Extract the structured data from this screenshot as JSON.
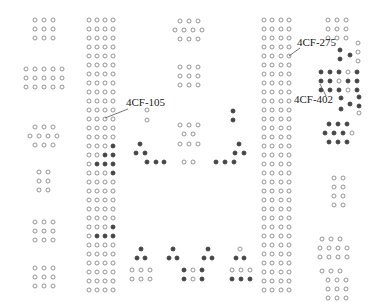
{
  "colors": {
    "open_stroke": "#8a8a8a",
    "filled": "#444444",
    "leader": "#555555",
    "text": "#222222"
  },
  "labels": [
    {
      "id": "4CF-105",
      "text": "4CF-105",
      "x": 126,
      "y": 103,
      "tx": 105,
      "ty": 118
    },
    {
      "id": "4CF-275",
      "text": "4CF-275",
      "x": 298,
      "y": 42,
      "tx": 289,
      "ty": 56
    },
    {
      "id": "4CF-402",
      "text": "4CF-402",
      "x": 296,
      "y": 98,
      "tx": 320,
      "ty": 84
    }
  ],
  "dot_radius": 2,
  "grids": [
    {
      "name": "left-a",
      "xs": [
        35,
        44,
        53
      ],
      "ys": [
        20,
        29,
        38
      ]
    },
    {
      "name": "left-b",
      "xs": [
        26,
        35,
        44,
        53,
        62
      ],
      "ys": [
        69,
        78,
        87
      ]
    },
    {
      "name": "left-c1",
      "xs": [
        35,
        44,
        53
      ],
      "ys": [
        127
      ]
    },
    {
      "name": "left-c2",
      "xs": [
        30,
        39,
        48,
        57
      ],
      "ys": [
        136
      ]
    },
    {
      "name": "left-c3",
      "xs": [
        35,
        44,
        53
      ],
      "ys": [
        145
      ]
    },
    {
      "name": "left-d",
      "xs": [
        39,
        48
      ],
      "ys": [
        172,
        181,
        190
      ]
    },
    {
      "name": "left-e",
      "xs": [
        35,
        44,
        53
      ],
      "ys": [
        222,
        231,
        240
      ]
    },
    {
      "name": "left-f",
      "xs": [
        35,
        44,
        53
      ],
      "ys": [
        268,
        277,
        286
      ]
    },
    {
      "name": "mid-a1",
      "xs": [
        180,
        189,
        198
      ],
      "ys": [
        21
      ]
    },
    {
      "name": "mid-a2",
      "xs": [
        175,
        184,
        193,
        202
      ],
      "ys": [
        30
      ]
    },
    {
      "name": "mid-a3",
      "xs": [
        180,
        189,
        198
      ],
      "ys": [
        39
      ]
    },
    {
      "name": "mid-b",
      "xs": [
        180,
        189,
        198
      ],
      "ys": [
        67,
        76,
        85
      ]
    },
    {
      "name": "column-2",
      "xs": [
        89,
        97,
        105,
        113
      ],
      "ys_start": 20,
      "ys_step": 9,
      "ys_count": 31
    },
    {
      "name": "column-4",
      "xs": [
        264,
        272,
        281,
        289
      ],
      "ys_start": 20,
      "ys_step": 9,
      "ys_count": 31
    },
    {
      "name": "right-a",
      "xs": [
        328,
        337,
        346
      ],
      "ys": [
        20,
        29,
        38
      ]
    },
    {
      "name": "right-b",
      "xs": [
        322,
        331,
        340
      ],
      "ys": [
        239
      ]
    },
    {
      "name": "right-c",
      "xs": [
        320,
        329,
        338,
        347
      ],
      "ys": [
        248,
        257
      ]
    },
    {
      "name": "right-d",
      "xs": [
        322,
        331,
        340
      ],
      "ys": [
        271
      ]
    },
    {
      "name": "right-e",
      "xs": [
        328,
        337,
        346
      ],
      "ys": [
        280,
        289,
        298
      ]
    },
    {
      "name": "right-f",
      "xs": [
        334,
        343
      ],
      "ys": [
        178,
        187,
        196,
        205
      ]
    }
  ],
  "filled_in_columns": {
    "column-2": [
      [
        14,
        3
      ],
      [
        15,
        2
      ],
      [
        15,
        3
      ],
      [
        16,
        1
      ],
      [
        16,
        2
      ],
      [
        16,
        3
      ],
      [
        17,
        3
      ],
      [
        23,
        3
      ],
      [
        24,
        1
      ],
      [
        24,
        2
      ],
      [
        24,
        3
      ]
    ],
    "column-4": []
  },
  "singles": [
    {
      "x": 147,
      "y": 110,
      "f": false
    },
    {
      "x": 147,
      "y": 120,
      "f": false
    },
    {
      "x": 233,
      "y": 111,
      "f": true
    },
    {
      "x": 233,
      "y": 120,
      "f": true
    },
    {
      "x": 140,
      "y": 144,
      "f": true
    },
    {
      "x": 136,
      "y": 153,
      "f": true
    },
    {
      "x": 145,
      "y": 153,
      "f": true
    },
    {
      "x": 147,
      "y": 162,
      "f": true
    },
    {
      "x": 156,
      "y": 162,
      "f": true
    },
    {
      "x": 164,
      "y": 162,
      "f": true
    },
    {
      "x": 180,
      "y": 125,
      "f": false
    },
    {
      "x": 189,
      "y": 125,
      "f": false
    },
    {
      "x": 198,
      "y": 125,
      "f": false
    },
    {
      "x": 184,
      "y": 134,
      "f": false
    },
    {
      "x": 193,
      "y": 134,
      "f": false
    },
    {
      "x": 180,
      "y": 144,
      "f": false
    },
    {
      "x": 189,
      "y": 144,
      "f": false
    },
    {
      "x": 198,
      "y": 144,
      "f": false
    },
    {
      "x": 184,
      "y": 162,
      "f": false
    },
    {
      "x": 193,
      "y": 162,
      "f": false
    },
    {
      "x": 216,
      "y": 162,
      "f": true
    },
    {
      "x": 225,
      "y": 162,
      "f": true
    },
    {
      "x": 234,
      "y": 162,
      "f": true
    },
    {
      "x": 239,
      "y": 144,
      "f": true
    },
    {
      "x": 235,
      "y": 153,
      "f": true
    },
    {
      "x": 244,
      "y": 153,
      "f": true
    },
    {
      "x": 141,
      "y": 249,
      "f": true
    },
    {
      "x": 137,
      "y": 258,
      "f": true
    },
    {
      "x": 145,
      "y": 258,
      "f": true
    },
    {
      "x": 132,
      "y": 270,
      "f": false
    },
    {
      "x": 141,
      "y": 270,
      "f": false
    },
    {
      "x": 150,
      "y": 270,
      "f": false
    },
    {
      "x": 132,
      "y": 279,
      "f": false
    },
    {
      "x": 141,
      "y": 279,
      "f": false
    },
    {
      "x": 150,
      "y": 279,
      "f": false
    },
    {
      "x": 173,
      "y": 249,
      "f": true
    },
    {
      "x": 169,
      "y": 258,
      "f": true
    },
    {
      "x": 177,
      "y": 258,
      "f": true
    },
    {
      "x": 184,
      "y": 270,
      "f": true
    },
    {
      "x": 193,
      "y": 270,
      "f": false
    },
    {
      "x": 202,
      "y": 270,
      "f": true
    },
    {
      "x": 184,
      "y": 279,
      "f": true
    },
    {
      "x": 193,
      "y": 279,
      "f": false
    },
    {
      "x": 202,
      "y": 279,
      "f": true
    },
    {
      "x": 208,
      "y": 249,
      "f": true
    },
    {
      "x": 204,
      "y": 258,
      "f": true
    },
    {
      "x": 212,
      "y": 258,
      "f": true
    },
    {
      "x": 240,
      "y": 249,
      "f": false
    },
    {
      "x": 236,
      "y": 258,
      "f": true
    },
    {
      "x": 244,
      "y": 258,
      "f": true
    },
    {
      "x": 232,
      "y": 270,
      "f": false
    },
    {
      "x": 241,
      "y": 270,
      "f": false
    },
    {
      "x": 250,
      "y": 270,
      "f": false
    },
    {
      "x": 232,
      "y": 279,
      "f": true
    },
    {
      "x": 241,
      "y": 279,
      "f": true
    },
    {
      "x": 250,
      "y": 279,
      "f": true
    },
    {
      "x": 358,
      "y": 43,
      "f": false
    },
    {
      "x": 358,
      "y": 52,
      "f": false
    },
    {
      "x": 358,
      "y": 61,
      "f": false
    },
    {
      "x": 340,
      "y": 50,
      "f": true
    },
    {
      "x": 350,
      "y": 55,
      "f": true
    },
    {
      "x": 340,
      "y": 59,
      "f": true
    },
    {
      "x": 321,
      "y": 72,
      "f": true
    },
    {
      "x": 330,
      "y": 72,
      "f": true
    },
    {
      "x": 339,
      "y": 72,
      "f": true
    },
    {
      "x": 348,
      "y": 72,
      "f": false
    },
    {
      "x": 357,
      "y": 72,
      "f": true
    },
    {
      "x": 321,
      "y": 81,
      "f": true
    },
    {
      "x": 330,
      "y": 81,
      "f": true
    },
    {
      "x": 339,
      "y": 81,
      "f": false
    },
    {
      "x": 348,
      "y": 81,
      "f": true
    },
    {
      "x": 357,
      "y": 81,
      "f": true
    },
    {
      "x": 321,
      "y": 90,
      "f": true
    },
    {
      "x": 330,
      "y": 90,
      "f": true
    },
    {
      "x": 339,
      "y": 90,
      "f": true
    },
    {
      "x": 348,
      "y": 90,
      "f": false
    },
    {
      "x": 357,
      "y": 90,
      "f": true
    },
    {
      "x": 341,
      "y": 98,
      "f": true
    },
    {
      "x": 359,
      "y": 97,
      "f": true
    },
    {
      "x": 350,
      "y": 104,
      "f": true
    },
    {
      "x": 359,
      "y": 106,
      "f": true
    },
    {
      "x": 341,
      "y": 109,
      "f": true
    },
    {
      "x": 359,
      "y": 113,
      "f": false
    },
    {
      "x": 329,
      "y": 124,
      "f": true
    },
    {
      "x": 338,
      "y": 124,
      "f": true
    },
    {
      "x": 347,
      "y": 124,
      "f": true
    },
    {
      "x": 325,
      "y": 133,
      "f": true
    },
    {
      "x": 334,
      "y": 133,
      "f": true
    },
    {
      "x": 343,
      "y": 133,
      "f": true
    },
    {
      "x": 352,
      "y": 133,
      "f": false
    },
    {
      "x": 329,
      "y": 142,
      "f": true
    },
    {
      "x": 338,
      "y": 142,
      "f": true
    },
    {
      "x": 347,
      "y": 142,
      "f": true
    }
  ]
}
